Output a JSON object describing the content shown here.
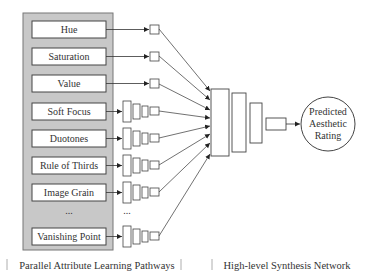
{
  "diagram": {
    "attributes": [
      {
        "label": "Hue",
        "pathway": "simple"
      },
      {
        "label": "Saturation",
        "pathway": "simple"
      },
      {
        "label": "Value",
        "pathway": "simple"
      },
      {
        "label": "Soft Focus",
        "pathway": "deep"
      },
      {
        "label": "Duotones",
        "pathway": "deep"
      },
      {
        "label": "Rule of Thirds",
        "pathway": "deep"
      },
      {
        "label": "Image Grain",
        "pathway": "deep"
      },
      {
        "label": "...",
        "pathway": "ellipsis"
      },
      {
        "label": "Vanishing Point",
        "pathway": "deep"
      }
    ],
    "pathway_ellipsis": "...",
    "output": {
      "line1": "Predicted",
      "line2": "Aesthetic",
      "line3": "Rating"
    },
    "captions": {
      "left": "Parallel Attribute Learning Pathways",
      "right": "High-level Synthesis Network"
    },
    "colors": {
      "panel_fill": "#c8c8c8",
      "panel_stroke": "#777777",
      "box_fill": "#ffffff",
      "line": "#333333"
    }
  }
}
